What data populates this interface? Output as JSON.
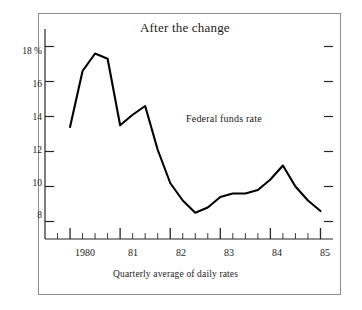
{
  "chart_data": {
    "type": "line",
    "title": "After the change",
    "subtitle": "",
    "caption": "Quarterly average of daily rates",
    "xlabel": "",
    "ylabel": "",
    "y_unit_label": "18 %",
    "grid": false,
    "legend_position": "inline-annotation",
    "series": [
      {
        "name": "Federal funds rate",
        "color": "#000000",
        "x": [
          1980.0,
          1980.25,
          1980.5,
          1980.75,
          1981.0,
          1981.25,
          1981.5,
          1981.75,
          1982.0,
          1982.25,
          1982.5,
          1982.75,
          1983.0,
          1983.25,
          1983.5,
          1983.75,
          1984.0,
          1984.25,
          1984.5,
          1984.75,
          1985.0
        ],
        "x_labels": [
          "1980 Q1",
          "1980 Q2",
          "1980 Q3",
          "1980 Q4",
          "1981 Q1",
          "1981 Q2",
          "1981 Q3",
          "1981 Q4",
          "1982 Q1",
          "1982 Q2",
          "1982 Q3",
          "1982 Q4",
          "1983 Q1",
          "1983 Q2",
          "1983 Q3",
          "1983 Q4",
          "1984 Q1",
          "1984 Q2",
          "1984 Q3",
          "1984 Q4",
          "1985 Q1"
        ],
        "values": [
          13.4,
          16.6,
          17.6,
          17.3,
          13.5,
          14.1,
          14.6,
          12.1,
          10.2,
          9.2,
          8.5,
          8.8,
          9.4,
          9.6,
          9.6,
          9.8,
          10.4,
          11.2,
          10.0,
          9.2,
          8.6
        ]
      }
    ],
    "xlim": [
      1979.5,
      1985.25
    ],
    "ylim": [
      7.0,
      19.0
    ],
    "yticks": [
      8,
      10,
      12,
      14,
      16,
      18
    ],
    "ytick_labels": [
      "8",
      "10",
      "12",
      "14",
      "16",
      "18 %"
    ],
    "xticks_major": [
      1980,
      1981,
      1982,
      1983,
      1984,
      1985
    ],
    "xtick_labels": [
      "1980",
      "81",
      "82",
      "83",
      "84",
      "85"
    ],
    "xticks_minor_per_major": 4,
    "annotations": [
      {
        "text": "Federal funds rate",
        "x": 1982.3,
        "y": 13.9
      }
    ]
  }
}
